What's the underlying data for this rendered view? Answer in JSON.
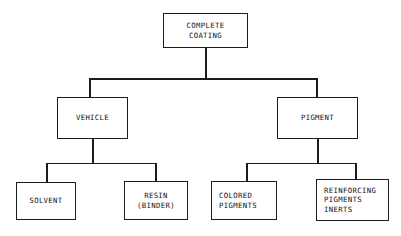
{
  "diagram": {
    "type": "hierarchy-tree",
    "background_color": "#ffffff",
    "line_color": "#1c1c1c",
    "text_color": "#101010",
    "nodes": {
      "root": {
        "id": "complete-coating",
        "lines": [
          "COMPLETE",
          "COATING"
        ],
        "level": 0
      },
      "vehicle": {
        "id": "vehicle",
        "lines": [
          "VEHICLE"
        ],
        "level": 1
      },
      "pigment": {
        "id": "pigment",
        "lines": [
          "PIGMENT"
        ],
        "level": 1
      },
      "solvent": {
        "id": "solvent",
        "lines": [
          "SOLVENT"
        ],
        "level": 2
      },
      "resin": {
        "id": "resin-binder",
        "lines": [
          "RESIN",
          "(BINDER)"
        ],
        "level": 2
      },
      "colored_pigments": {
        "id": "colored-pigments",
        "lines": [
          "COLORED",
          "PIGMENTS"
        ],
        "level": 2
      },
      "reinforcing": {
        "id": "reinforcing-pigments-inerts",
        "lines": [
          "REINFORCING",
          "PIGMENTS",
          "INERTS"
        ],
        "level": 2
      }
    },
    "edges": [
      {
        "from": "complete-coating",
        "to": "vehicle"
      },
      {
        "from": "complete-coating",
        "to": "pigment"
      },
      {
        "from": "vehicle",
        "to": "solvent"
      },
      {
        "from": "vehicle",
        "to": "resin-binder"
      },
      {
        "from": "pigment",
        "to": "colored-pigments"
      },
      {
        "from": "pigment",
        "to": "reinforcing-pigments-inerts"
      }
    ]
  }
}
